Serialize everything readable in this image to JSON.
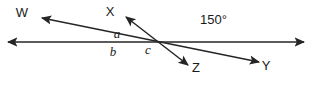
{
  "diagram": {
    "type": "geometry-line-diagram",
    "stroke_color": "#252525",
    "background_color": "#ffffff",
    "label_color": "#1a1a1a",
    "stroke_width": 1.5,
    "point_labels": [
      {
        "id": "W",
        "text": "W",
        "x": 22,
        "y": 17
      },
      {
        "id": "X",
        "text": "X",
        "x": 110,
        "y": 16
      },
      {
        "id": "Z",
        "text": "Z",
        "x": 196,
        "y": 72
      },
      {
        "id": "Y",
        "text": "Y",
        "x": 266,
        "y": 70
      }
    ],
    "angle_labels": [
      {
        "id": "a",
        "text": "a",
        "x": 117,
        "y": 38,
        "style": "italic-variable"
      },
      {
        "id": "b",
        "text": "b",
        "x": 113,
        "y": 56,
        "style": "italic-variable"
      },
      {
        "id": "c",
        "text": "c",
        "x": 148,
        "y": 54,
        "style": "italic-variable"
      },
      {
        "id": "angle-150",
        "text": "150°",
        "x": 200,
        "y": 24,
        "style": "measure"
      }
    ],
    "lines": [
      {
        "id": "horizontal-line",
        "from": {
          "x": 8,
          "y": 42
        },
        "to": {
          "x": 304,
          "y": 42
        },
        "arrow_start": true,
        "arrow_end": true
      },
      {
        "id": "ray-WY",
        "from": {
          "x": 42,
          "y": 18
        },
        "to": {
          "x": 259,
          "y": 62
        },
        "arrow_start": true,
        "arrow_end": true
      },
      {
        "id": "ray-XZ",
        "from": {
          "x": 126,
          "y": 17
        },
        "to": {
          "x": 188,
          "y": 65
        },
        "arrow_start": true,
        "arrow_end": true
      }
    ],
    "intersections": [
      {
        "id": "left-intersection",
        "x": 112,
        "y": 42
      },
      {
        "id": "right-intersection",
        "x": 190,
        "y": 42
      }
    ]
  }
}
